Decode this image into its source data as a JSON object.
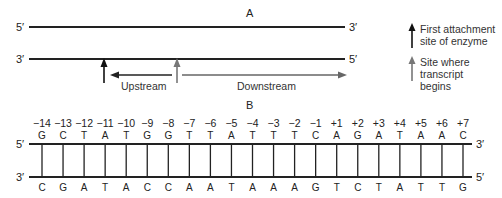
{
  "panel_a": {
    "title": "A",
    "top_strand": {
      "left_end": "5′",
      "right_end": "3′"
    },
    "bottom_strand": {
      "left_end": "3′",
      "right_end": "5′"
    },
    "upstream_label": "Upstream",
    "downstream_label": "Downstream",
    "legend": [
      {
        "icon": "black-arrow-up",
        "color": "#111111",
        "text_line1": "First attachment",
        "text_line2": "site of enzyme"
      },
      {
        "icon": "gray-arrow-up",
        "color": "#777777",
        "text_line1": "Site where transcript",
        "text_line2": "begins"
      }
    ]
  },
  "panel_b": {
    "title": "B",
    "top_strand": {
      "left_end": "5′",
      "right_end": "3′"
    },
    "bottom_strand": {
      "left_end": "3′",
      "right_end": "5′"
    },
    "positions": [
      "−14",
      "−13",
      "−12",
      "−11",
      "−10",
      "−9",
      "−8",
      "−7",
      "−6",
      "−5",
      "−4",
      "−3",
      "−2",
      "−1",
      "+1",
      "+2",
      "+3",
      "+4",
      "+5",
      "+6",
      "+7"
    ],
    "top_bases": [
      "G",
      "C",
      "T",
      "A",
      "T",
      "G",
      "G",
      "T",
      "T",
      "A",
      "T",
      "T",
      "T",
      "C",
      "A",
      "G",
      "A",
      "T",
      "A",
      "A",
      "C"
    ],
    "bottom_bases": [
      "C",
      "G",
      "A",
      "T",
      "A",
      "C",
      "C",
      "A",
      "A",
      "T",
      "A",
      "A",
      "A",
      "G",
      "T",
      "C",
      "T",
      "A",
      "T",
      "T",
      "G"
    ]
  },
  "colors": {
    "black_arrow": "#111111",
    "gray_arrow": "#777777",
    "strand": "#222222"
  }
}
